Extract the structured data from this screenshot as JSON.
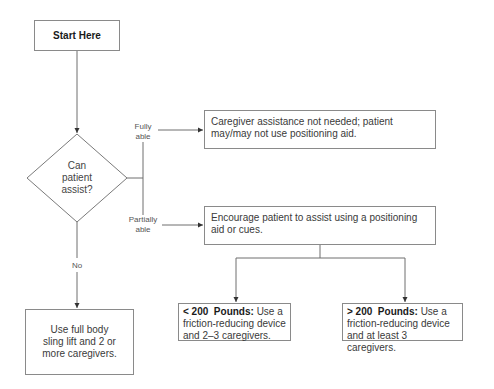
{
  "diagram": {
    "type": "flowchart",
    "nodes": {
      "start": {
        "label": "Start Here"
      },
      "decision": {
        "lines": [
          "Can",
          "patient",
          "assist?"
        ]
      },
      "fully_able_result": {
        "text": "Caregiver assistance not needed; patient may/may not use positioning aid."
      },
      "partially_able_result": {
        "text": "Encourage patient to assist using a positioning aid or cues."
      },
      "under_200": {
        "bold": "< 200  Pounds:",
        "text": " Use a friction-reducing device and 2–3 caregivers."
      },
      "over_200": {
        "bold": "> 200  Pounds:",
        "text": " Use a friction-reducing device and at least 3 caregivers."
      },
      "no_result": {
        "text": "Use full body sling lift and 2 or more caregivers."
      }
    },
    "edge_labels": {
      "fully_line1": "Fully",
      "fully_line2": "able",
      "partially_line1": "Partially",
      "partially_line2": "able",
      "no": "No"
    },
    "colors": {
      "line": "#6f6f6f",
      "border": "#8a8a8a",
      "text": "#3a3a3a"
    }
  }
}
